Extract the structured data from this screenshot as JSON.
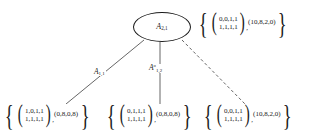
{
  "diagram": {
    "background_color": "#ffffff",
    "stroke_color": "#1a1a1a",
    "root_node": {
      "name": "A",
      "sub": "2,1"
    },
    "edge_labels": [
      {
        "name": "A",
        "sub": "1,1",
        "sup": ""
      },
      {
        "name": "A",
        "sub": "1,2",
        "sup": "o"
      }
    ],
    "sets": {
      "root": {
        "open_brace": "{",
        "open_paren": "(",
        "matrix_row1": "0,0,1,1",
        "matrix_row2": "1,1,1,1",
        "close_paren": ")",
        "comma": ",",
        "vector": "(10,8,2,0)",
        "close_brace": "}"
      },
      "left": {
        "open_brace": "{",
        "open_paren": "(",
        "matrix_row1": "1,0,1,1",
        "matrix_row2": "1,1,1,1",
        "close_paren": ")",
        "comma": ",",
        "vector": "(0,8,0,8)",
        "close_brace": "}"
      },
      "middle": {
        "open_brace": "{",
        "open_paren": "(",
        "matrix_row1": "0,1,1,1",
        "matrix_row2": "1,1,1,1",
        "close_paren": ")",
        "comma": ",",
        "vector": "(0,8,0,8)",
        "close_brace": "}"
      },
      "right": {
        "open_brace": "{",
        "open_paren": "(",
        "matrix_row1": "0,0,1,1",
        "matrix_row2": "1,1,1,1",
        "close_paren": ")",
        "comma": ",",
        "vector": "(10,8,2,0)",
        "close_brace": "}"
      }
    }
  }
}
